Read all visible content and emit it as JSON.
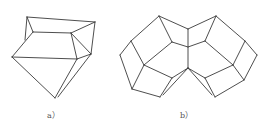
{
  "figures": [
    {
      "id": "a",
      "caption": "a）",
      "caption_pos": [
        47,
        109
      ],
      "edges": [
        [
          [
            27,
            17
          ],
          [
            95,
            22
          ]
        ],
        [
          [
            27,
            17
          ],
          [
            33,
            32
          ]
        ],
        [
          [
            27,
            17
          ],
          [
            25,
            40
          ]
        ],
        [
          [
            33,
            32
          ],
          [
            71,
            33
          ]
        ],
        [
          [
            33,
            32
          ],
          [
            12,
            57
          ]
        ],
        [
          [
            95,
            22
          ],
          [
            71,
            33
          ]
        ],
        [
          [
            95,
            22
          ],
          [
            91,
            54
          ]
        ],
        [
          [
            71,
            33
          ],
          [
            77,
            59
          ]
        ],
        [
          [
            71,
            33
          ],
          [
            91,
            54
          ]
        ],
        [
          [
            12,
            57
          ],
          [
            77,
            59
          ]
        ],
        [
          [
            12,
            57
          ],
          [
            55,
            98
          ]
        ],
        [
          [
            77,
            59
          ],
          [
            91,
            54
          ]
        ],
        [
          [
            77,
            59
          ],
          [
            55,
            98
          ]
        ],
        [
          [
            91,
            54
          ],
          [
            58,
            97
          ]
        ]
      ]
    },
    {
      "id": "b",
      "caption": "b）",
      "caption_pos": [
        180,
        109
      ],
      "edges": [
        [
          [
            159,
            16
          ],
          [
            131,
            41
          ]
        ],
        [
          [
            131,
            41
          ],
          [
            120,
            55
          ]
        ],
        [
          [
            120,
            55
          ],
          [
            132,
            89
          ]
        ],
        [
          [
            132,
            89
          ],
          [
            160,
            97
          ]
        ],
        [
          [
            159,
            16
          ],
          [
            172,
            42
          ]
        ],
        [
          [
            159,
            16
          ],
          [
            188,
            29
          ]
        ],
        [
          [
            188,
            29
          ],
          [
            216,
            16
          ]
        ],
        [
          [
            188,
            29
          ],
          [
            188,
            68
          ]
        ],
        [
          [
            172,
            42
          ],
          [
            188,
            47
          ]
        ],
        [
          [
            188,
            47
          ],
          [
            205,
            41
          ]
        ],
        [
          [
            131,
            41
          ],
          [
            144,
            65
          ]
        ],
        [
          [
            172,
            42
          ],
          [
            144,
            65
          ]
        ],
        [
          [
            144,
            65
          ],
          [
            132,
            89
          ]
        ],
        [
          [
            144,
            65
          ],
          [
            172,
            78
          ]
        ],
        [
          [
            172,
            78
          ],
          [
            188,
            68
          ]
        ],
        [
          [
            172,
            78
          ],
          [
            160,
            97
          ]
        ],
        [
          [
            188,
            68
          ],
          [
            163,
            95
          ]
        ],
        [
          [
            216,
            16
          ],
          [
            245,
            41
          ]
        ],
        [
          [
            245,
            41
          ],
          [
            257,
            55
          ]
        ],
        [
          [
            257,
            55
          ],
          [
            244,
            80
          ]
        ],
        [
          [
            244,
            80
          ],
          [
            215,
            97
          ]
        ],
        [
          [
            216,
            16
          ],
          [
            205,
            41
          ]
        ],
        [
          [
            245,
            41
          ],
          [
            233,
            65
          ]
        ],
        [
          [
            205,
            41
          ],
          [
            233,
            65
          ]
        ],
        [
          [
            233,
            65
          ],
          [
            244,
            80
          ]
        ],
        [
          [
            233,
            65
          ],
          [
            205,
            78
          ]
        ],
        [
          [
            205,
            78
          ],
          [
            188,
            68
          ]
        ],
        [
          [
            205,
            78
          ],
          [
            215,
            97
          ]
        ],
        [
          [
            188,
            68
          ],
          [
            212,
            95
          ]
        ]
      ]
    }
  ]
}
